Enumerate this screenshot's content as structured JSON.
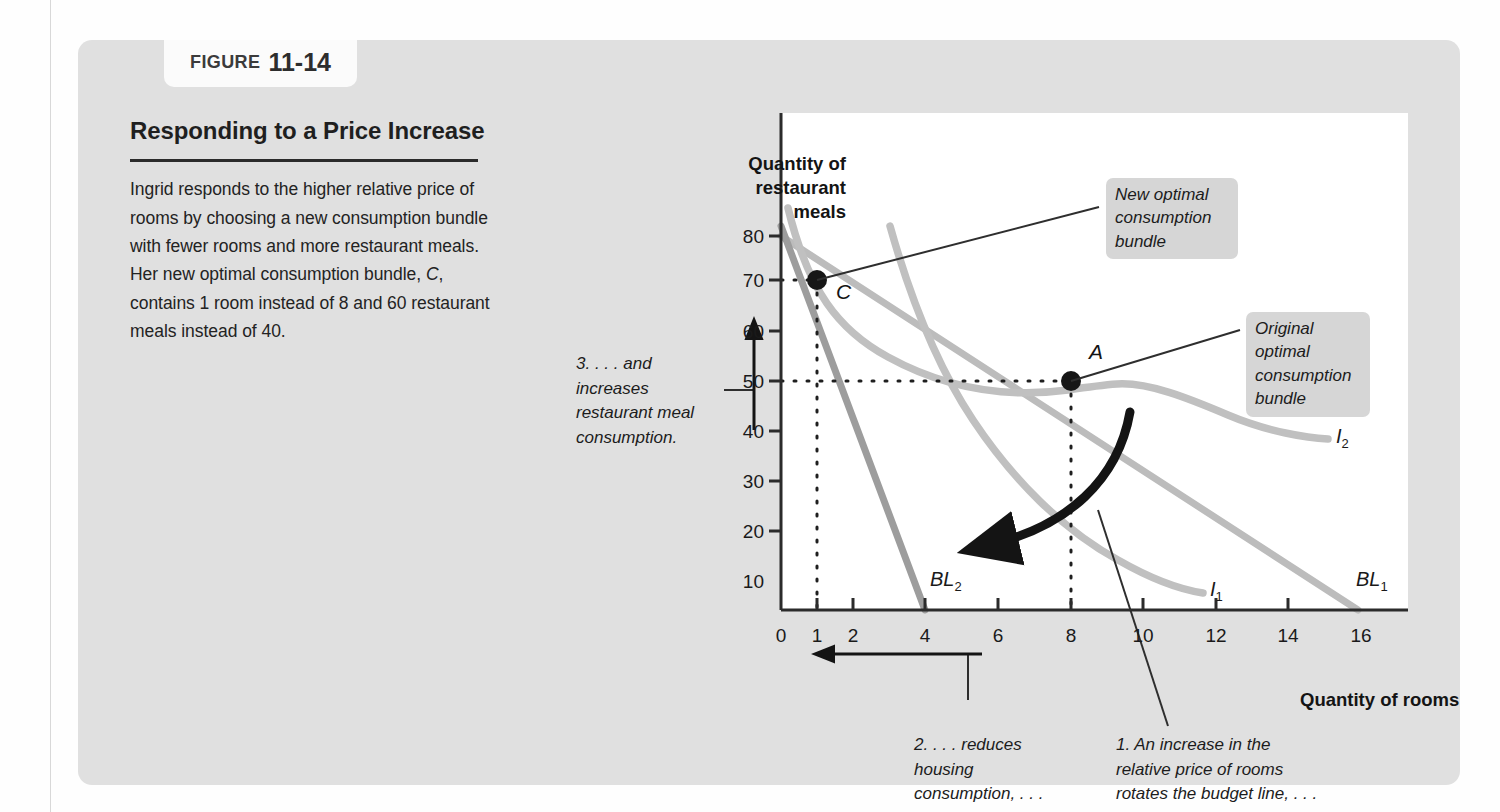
{
  "figure": {
    "tab_word": "FIGURE",
    "tab_number": "11-14",
    "title": "Responding to a Price Increase",
    "body": "Ingrid responds to the higher relative price of rooms by choosing a new consumption bundle with fewer rooms and more restaurant meals. Her new optimal consumption bundle, C, contains 1 room instead of 8 and 60 restaurant meals instead of 40."
  },
  "callouts": {
    "new_bundle": "New optimal\nconsumption\nbundle",
    "original_bundle": "Original\noptimal\nconsumption\nbundle",
    "note_three": "3. . . . and\nincreases\nrestaurant meal\nconsumption.",
    "note_two": "2. . . . reduces\nhousing\nconsumption, . . .",
    "note_one": "1. An increase in the\nrelative price of rooms\nrotates the budget line, . . ."
  },
  "colors": {
    "panel_background": "#e0e0e0",
    "plot_background": "#ffffff",
    "budget_line_1": "#b9b9b9",
    "budget_line_2": "#9a9a9a",
    "indifference_curve": "#bdbdbd",
    "axis": "#2b2b2b",
    "point": "#1a1a1a",
    "arrow_dark": "#141414",
    "callout_background": "#d6d6d6"
  },
  "chart_data": {
    "type": "line",
    "title": "Responding to a Price Increase",
    "xlabel": "Quantity of rooms",
    "ylabel": "Quantity of restaurant meals",
    "xlim": [
      0,
      17.3
    ],
    "ylim": [
      0,
      88
    ],
    "grid": false,
    "legend": "inline-curve-labels",
    "x_ticks": [
      0,
      1,
      2,
      4,
      6,
      8,
      10,
      12,
      14,
      16
    ],
    "x_tick_labels": [
      "0",
      "1",
      "2",
      "4",
      "6",
      "8",
      "10",
      "12",
      "14",
      "16"
    ],
    "y_ticks": [
      10,
      20,
      30,
      40,
      50,
      60,
      70,
      80
    ],
    "y_tick_labels": [
      "10",
      "20",
      "30",
      "40",
      "50",
      "60",
      "70",
      "80"
    ],
    "series": [
      {
        "name": "BL1",
        "label": "BL",
        "label_sub": "1",
        "kind": "budget-line",
        "points": [
          [
            0,
            80
          ],
          [
            16,
            0
          ]
        ],
        "label_pos": [
          16.0,
          5.0
        ]
      },
      {
        "name": "BL2",
        "label": "BL",
        "label_sub": "2",
        "kind": "budget-line",
        "points": [
          [
            0,
            82
          ],
          [
            4,
            0
          ]
        ],
        "label_pos": [
          4.35,
          6.0
        ]
      },
      {
        "name": "I1",
        "label": "I",
        "label_sub": "1",
        "kind": "indifference-curve",
        "points": [
          [
            3.0,
            82
          ],
          [
            4.0,
            58
          ],
          [
            5.0,
            42
          ],
          [
            6.0,
            31
          ],
          [
            7.0,
            23
          ],
          [
            8.0,
            17
          ],
          [
            9.0,
            13
          ],
          [
            9.9,
            10.5
          ]
        ],
        "label_pos": [
          10.15,
          10.0
        ]
      },
      {
        "name": "I2",
        "label": "I",
        "label_sub": "2",
        "kind": "indifference-curve",
        "points": [
          [
            0.2,
            84
          ],
          [
            1.0,
            60
          ],
          [
            2.0,
            50.5
          ],
          [
            3.5,
            43.5
          ],
          [
            5.0,
            40.0
          ],
          [
            6.5,
            39.0
          ],
          [
            8.0,
            40.0
          ],
          [
            9.5,
            37.0
          ],
          [
            11.0,
            34.5
          ],
          [
            12.6,
            33.5
          ]
        ],
        "label_pos": [
          12.85,
          33.0
        ]
      }
    ],
    "points": [
      {
        "label": "A",
        "x": 8,
        "y": 40,
        "description": "Original optimal consumption bundle"
      },
      {
        "label": "C",
        "x": 1,
        "y": 60,
        "description": "New optimal consumption bundle"
      }
    ],
    "annotations": [
      {
        "id": "rotation-arrow",
        "text": "budget line rotation",
        "from": [
          8,
          33
        ],
        "to": [
          4.3,
          13
        ]
      },
      {
        "id": "housing-arrow",
        "text": "reduces housing consumption",
        "from": [
          8,
          -6
        ],
        "to": [
          1,
          -6
        ]
      },
      {
        "id": "meals-arrow",
        "text": "increases restaurant meal consumption",
        "from": [
          -1.2,
          38
        ],
        "to": [
          -1.2,
          62
        ]
      }
    ]
  },
  "axis_titles": {
    "y": "Quantity of\nrestaurant\nmeals",
    "x": "Quantity of rooms"
  }
}
